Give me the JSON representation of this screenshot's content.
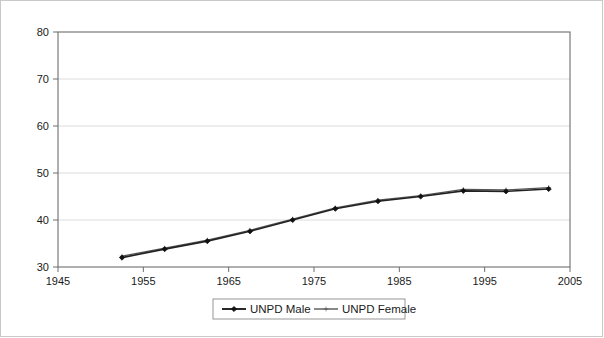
{
  "chart_data": {
    "type": "line",
    "title": "",
    "subtitle": "",
    "xlabel": "",
    "ylabel": "",
    "xlim": [
      1945,
      2005
    ],
    "ylim": [
      30,
      80
    ],
    "xticks": [
      1945,
      1955,
      1965,
      1975,
      1985,
      1995,
      2005
    ],
    "xtick_labels": [
      "1945",
      "1955",
      "1965",
      "1975",
      "1985",
      "1995",
      "2005"
    ],
    "yticks": [
      30,
      40,
      50,
      60,
      70,
      80
    ],
    "ytick_labels": [
      "30",
      "40",
      "50",
      "60",
      "70",
      "80"
    ],
    "grid": "horizontal",
    "legend_position": "bottom",
    "x": [
      1952.5,
      1957.5,
      1962.5,
      1967.5,
      1972.5,
      1977.5,
      1982.5,
      1987.5,
      1992.5,
      1997.5,
      2002.5
    ],
    "series": [
      {
        "name": "UNPD Male",
        "color": "#111111",
        "marker": "diamond",
        "values": [
          32.0,
          33.8,
          35.5,
          37.6,
          40.0,
          42.4,
          44.0,
          45.0,
          46.2,
          46.1,
          46.6
        ]
      },
      {
        "name": "UNPD Female",
        "color": "#4a4a4a",
        "marker": "plus",
        "values": [
          32.3,
          34.0,
          35.7,
          37.8,
          40.2,
          42.6,
          44.2,
          45.2,
          46.5,
          46.4,
          46.9
        ]
      }
    ]
  },
  "legend": {
    "items": [
      {
        "label": "UNPD Male"
      },
      {
        "label": "UNPD Female"
      }
    ]
  }
}
